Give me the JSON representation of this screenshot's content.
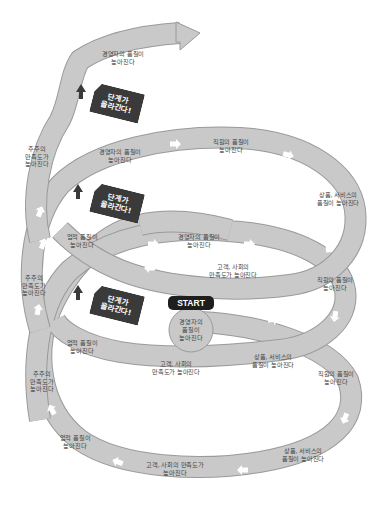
{
  "diagram": {
    "type": "spiral-growth-cycle",
    "colors": {
      "ribbon_fill": "#c9c9c9",
      "ribbon_stroke": "#9a9a9a",
      "arrow_marker": "#ffffff",
      "step_up_arrow": "#3a3a3a",
      "badge_fill": "#3a3a3a",
      "start_fill": "#1e1e1e"
    },
    "start": {
      "label": "START",
      "text": "경영자의\n품질이\n높아진다"
    },
    "badges": [
      {
        "text": "단계가\n올라간다!"
      },
      {
        "text": "단계가\n올라간다!"
      },
      {
        "text": "단계가\n올라간다!"
      }
    ],
    "labels": {
      "l1_customer": "고객, 사회의\n만족도가 높아진다",
      "l1_product": "상품, 서비스의\n품질이 높아진다",
      "l1_staff": "직원의 품질이\n높아진다",
      "l1_shareholder": "주주의\n만족도가\n높아진다",
      "l1_business": "업적 품질이\n높아진다",
      "l2_manager": "경영자의 품질이\n높아진다",
      "l2_staff": "직원의 품질이\n높아진다",
      "l2_product": "상품, 서비스의\n품질이 높아진다",
      "l2_customer": "고객, 사회의\n만족도가 높아진다",
      "l2_business": "업적 품질이\n높아진다",
      "l2_shareholder": "주주의\n만족도가\n높아진다",
      "l3_manager": "경영자의 품질이\n높아진다",
      "l3_staff": "직원의 품질이\n높아진다",
      "l3_product": "상품, 서비스의\n품질이 높아진다",
      "l3_shareholder": "주주의\n만족도가\n높아진다",
      "l4_manager": "경영자의 품질이\n높아진다",
      "bottom_customer": "고객, 사회의 만족도가\n높아진다",
      "bottom_product": "상품, 서비스의\n품질이 높아진다",
      "bottom_staff": "직원의 품질이\n높아진다",
      "bottom_business": "업적 품질이\n높아진다",
      "bottom_shareholder": "주주의\n만족도가\n높아진다"
    }
  }
}
